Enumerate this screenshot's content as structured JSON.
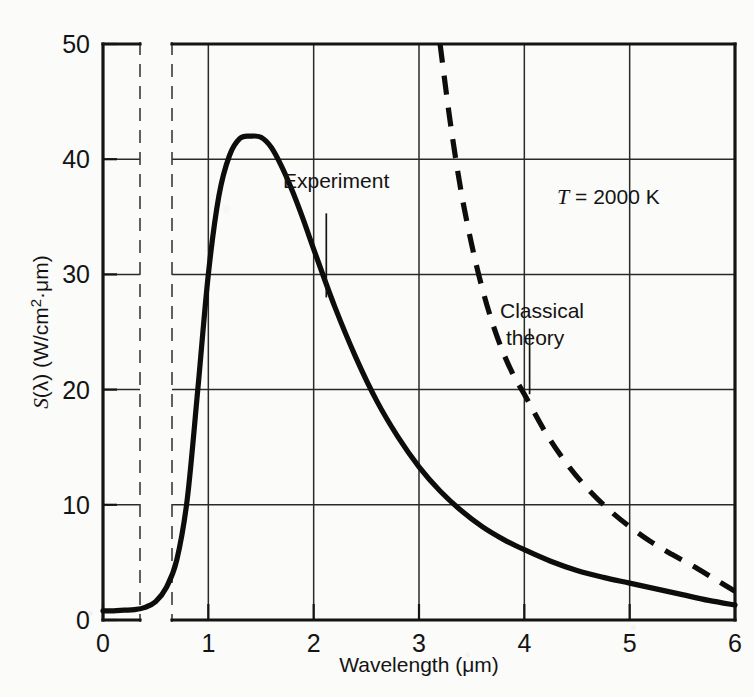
{
  "chart_data": {
    "type": "line",
    "title": "",
    "xlabel": "Wavelength (μm)",
    "ylabel": "S(λ) (W/cm²·μm)",
    "ylabel_parts": {
      "s": "S",
      "lambda": "(λ)",
      "units_pre": " (W/cm",
      "units_sup": "2",
      "units_post": "·",
      "units_mu": "μ",
      "units_end": "m)"
    },
    "xlabel_parts": {
      "name": "Wavelength (",
      "mu": "μ",
      "unit_end": "m)"
    },
    "xlim": [
      0,
      6
    ],
    "ylim": [
      0,
      50
    ],
    "xticks": [
      0,
      1,
      2,
      3,
      4,
      5,
      6
    ],
    "xtick_labels": [
      "0",
      "1",
      "2",
      "3",
      "4",
      "5",
      "6"
    ],
    "yticks": [
      0,
      10,
      20,
      30,
      40,
      50
    ],
    "ytick_labels": [
      "0",
      "10",
      "20",
      "30",
      "40",
      "50"
    ],
    "grid": true,
    "grid_color": "#2a2a2a",
    "axis_color": "#141414",
    "curve_color": "#0d0d0d",
    "background_color": "#fbfbf9",
    "axis_break": {
      "present": true,
      "description": "vertical dashed break in x-axis between 0.35 and 0.65 micrometers",
      "x_positions": [
        0.35,
        0.65
      ]
    },
    "legend_position": "inline-annotations",
    "annotations": [
      {
        "name": "experiment-label",
        "text": "Experiment",
        "x": 2.0,
        "y": 37.5,
        "leader_to": {
          "x": 2.12,
          "y": 28.0
        }
      },
      {
        "name": "classical-theory-label",
        "text": "Classical theory",
        "line1": "Classical",
        "line2": "theory",
        "x": 4.1,
        "y": 27.5,
        "leader_to": {
          "x": 4.05,
          "y": 19.6
        }
      },
      {
        "name": "temperature-label",
        "text": "T = 2000 K",
        "symbol": "T",
        "value": " = 2000 K",
        "x": 4.5,
        "y": 36.0
      }
    ],
    "series": [
      {
        "name": "Experiment",
        "style": "solid",
        "label": "Experiment",
        "x": [
          0.0,
          0.1,
          0.2,
          0.3,
          0.4,
          0.5,
          0.6,
          0.7,
          0.8,
          0.9,
          1.0,
          1.1,
          1.2,
          1.3,
          1.4,
          1.5,
          1.6,
          1.7,
          1.8,
          1.9,
          2.0,
          2.2,
          2.4,
          2.6,
          2.8,
          3.0,
          3.2,
          3.4,
          3.6,
          3.8,
          4.0,
          4.25,
          4.5,
          4.75,
          5.0,
          5.25,
          5.5,
          5.75,
          6.0
        ],
        "y": [
          0.8,
          0.8,
          0.85,
          0.9,
          1.1,
          1.6,
          2.8,
          5.2,
          10.5,
          20.0,
          30.0,
          36.8,
          40.3,
          41.8,
          42.0,
          41.9,
          41.0,
          39.3,
          37.2,
          34.8,
          32.2,
          27.2,
          22.8,
          19.0,
          15.9,
          13.3,
          11.2,
          9.5,
          8.1,
          7.0,
          6.1,
          5.1,
          4.3,
          3.7,
          3.2,
          2.7,
          2.2,
          1.7,
          1.3
        ]
      },
      {
        "name": "Classical theory",
        "style": "dashed",
        "label": "Classical theory",
        "x": [
          3.2,
          3.3,
          3.4,
          3.5,
          3.6,
          3.7,
          3.8,
          3.9,
          4.0,
          4.2,
          4.4,
          4.6,
          4.8,
          5.0,
          5.2,
          5.4,
          5.6,
          5.8,
          6.0
        ],
        "y": [
          50.0,
          43.0,
          37.2,
          32.6,
          28.8,
          25.7,
          23.2,
          21.2,
          19.6,
          16.3,
          13.6,
          11.4,
          9.6,
          8.1,
          6.8,
          5.7,
          4.7,
          3.6,
          2.5
        ]
      }
    ]
  }
}
